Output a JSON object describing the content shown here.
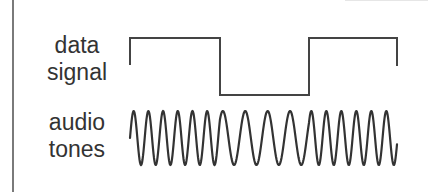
{
  "labels": {
    "data_signal": {
      "line1": "data",
      "line2": "signal"
    },
    "audio_tones": {
      "line1": "audio",
      "line2": "tones"
    }
  },
  "colors": {
    "text": "#333333",
    "stroke": "#444444",
    "frame": "#7a7a7a"
  },
  "diagram": {
    "data_signal": {
      "bits": [
        1,
        0,
        1
      ],
      "high_y": 38,
      "low_y": 95,
      "start_y": 65,
      "end_y": 66,
      "segments_x": [
        130,
        220,
        309,
        397
      ]
    },
    "audio_tones": {
      "center_y": 138,
      "amplitude": 27,
      "segments": [
        {
          "bit": 1,
          "x_start": 130,
          "x_end": 220,
          "period": 14.7
        },
        {
          "bit": 0,
          "x_start": 220,
          "x_end": 309,
          "period": 22.4
        },
        {
          "bit": 1,
          "x_start": 309,
          "x_end": 397,
          "period": 15.0
        }
      ]
    }
  }
}
